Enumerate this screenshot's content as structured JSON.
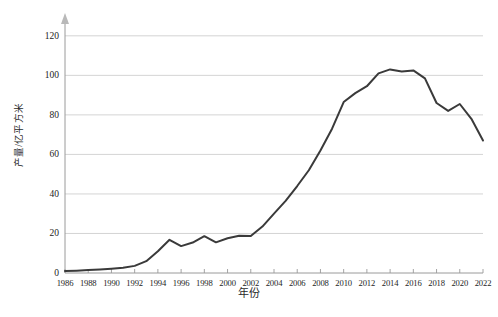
{
  "chart_data": {
    "type": "line",
    "title": "",
    "xlabel": "年份",
    "ylabel": "产量/亿平方米",
    "ylim": [
      0,
      128
    ],
    "xlim": [
      1986,
      2022
    ],
    "grid": true,
    "legend": null,
    "line_color": "#3a3a3a",
    "grid_color": "#cfcfcf",
    "axis_color": "#9a9a9a",
    "y_ticks": [
      0,
      20,
      40,
      60,
      80,
      100,
      120
    ],
    "x_ticks": [
      1986,
      1988,
      1990,
      1992,
      1994,
      1996,
      1998,
      2000,
      2002,
      2004,
      2006,
      2008,
      2010,
      2012,
      2014,
      2016,
      2018,
      2020,
      2022
    ],
    "x": [
      1986,
      1987,
      1988,
      1989,
      1990,
      1991,
      1992,
      1993,
      1994,
      1995,
      1996,
      1997,
      1998,
      1999,
      2000,
      2001,
      2002,
      2003,
      2004,
      2005,
      2006,
      2007,
      2008,
      2009,
      2010,
      2011,
      2012,
      2013,
      2014,
      2015,
      2016,
      2017,
      2018,
      2019,
      2020,
      2021,
      2022
    ],
    "values": [
      1.0,
      1.2,
      1.5,
      1.8,
      2.2,
      2.6,
      3.6,
      6.0,
      11.0,
      16.8,
      13.6,
      15.4,
      18.6,
      15.5,
      17.6,
      18.8,
      18.7,
      23.5,
      30.0,
      36.5,
      44.0,
      52.0,
      62.0,
      73.0,
      86.5,
      91.0,
      94.5,
      101.0,
      103.0,
      102.0,
      102.5,
      98.5,
      86.0,
      82.0,
      85.5,
      78.0,
      67.0
    ]
  },
  "axes": {
    "y_axis_arrow": "up-arrow-icon",
    "y_label": "产量/亿平方米",
    "x_label": "年份"
  },
  "caption": {
    "text": ""
  }
}
